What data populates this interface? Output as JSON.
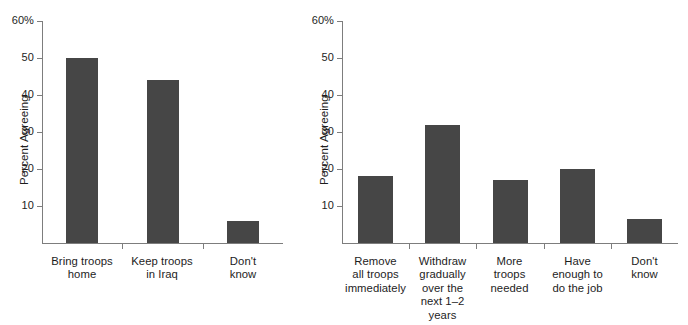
{
  "chart_data": [
    {
      "type": "bar",
      "title": "",
      "xlabel": "",
      "ylabel": "Percent Agreeing",
      "ylim": [
        0,
        60
      ],
      "y_ticks": [
        10,
        20,
        30,
        40,
        50,
        60
      ],
      "y_tick_labels": [
        "10",
        "20",
        "30",
        "40",
        "50",
        "60%"
      ],
      "grid": false,
      "legend": "none",
      "bar_color": "#464646",
      "axis_color": "#7d7d7d",
      "categories": [
        "Bring troops\nhome",
        "Keep troops\nin Iraq",
        "Don't\nknow"
      ],
      "values": [
        50,
        44,
        6
      ]
    },
    {
      "type": "bar",
      "title": "",
      "xlabel": "",
      "ylabel": "Percent Agreeing",
      "ylim": [
        0,
        60
      ],
      "y_ticks": [
        10,
        20,
        30,
        40,
        50,
        60
      ],
      "y_tick_labels": [
        "10",
        "20",
        "30",
        "40",
        "50",
        "60%"
      ],
      "grid": false,
      "legend": "none",
      "bar_color": "#464646",
      "axis_color": "#7d7d7d",
      "categories": [
        "Remove\nall troops\nimmediately",
        "Withdraw\ngradually\nover the\nnext 1–2\nyears",
        "More\ntroops\nneeded",
        "Have\nenough to\ndo the job",
        "Don't\nknow"
      ],
      "values": [
        18,
        32,
        17,
        20,
        6.5
      ]
    }
  ]
}
